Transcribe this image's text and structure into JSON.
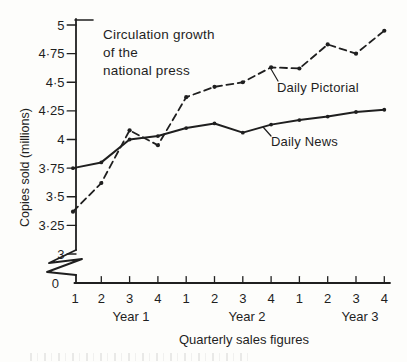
{
  "colors": {
    "ink": "#1f1f1f",
    "paper": "#fdfdfb"
  },
  "chart_data": {
    "type": "line",
    "title": "Circulation growth of the national press",
    "title_lines": [
      "Circulation growth",
      "of the",
      "national press"
    ],
    "ylabel": "Copies sold (millions)",
    "xlabel": "Quarterly sales figures",
    "ylim": [
      3,
      5
    ],
    "y_axis_break_to_zero": true,
    "origin_label": "0",
    "grid": false,
    "legend": "inline-annotations",
    "y_ticks": [
      {
        "label": "5",
        "value": 5
      },
      {
        "label": "4·75",
        "value": 4.75
      },
      {
        "label": "4·5",
        "value": 4.5
      },
      {
        "label": "4·25",
        "value": 4.25
      },
      {
        "label": "4",
        "value": 4
      },
      {
        "label": "3·75",
        "value": 3.75
      },
      {
        "label": "3·5",
        "value": 3.5
      },
      {
        "label": "3·25",
        "value": 3.25
      },
      {
        "label": "3",
        "value": 3
      }
    ],
    "x_quarter_labels": [
      "1",
      "2",
      "3",
      "4",
      "1",
      "2",
      "3",
      "4",
      "1",
      "2",
      "3",
      "4"
    ],
    "year_labels": [
      "Year 1",
      "Year 2",
      "Year 3"
    ],
    "series": [
      {
        "name": "Daily News",
        "line_style": "solid",
        "marker": "dot",
        "values": [
          3.75,
          3.8,
          4.0,
          4.03,
          4.1,
          4.14,
          4.06,
          4.13,
          4.17,
          4.2,
          4.24,
          4.26
        ]
      },
      {
        "name": "Daily Pictorial",
        "line_style": "dashed",
        "marker": "dot",
        "values": [
          3.37,
          3.62,
          4.08,
          3.95,
          4.37,
          4.46,
          4.5,
          4.63,
          4.62,
          4.83,
          4.75,
          4.95
        ]
      }
    ]
  }
}
